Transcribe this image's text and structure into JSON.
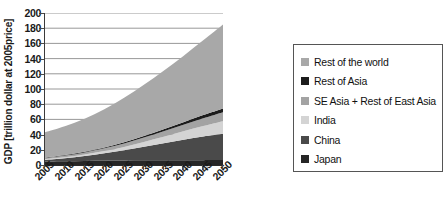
{
  "chart_data": {
    "type": "area",
    "stacked": true,
    "title": "",
    "xlabel": "",
    "ylabel": "GDP [trillion dollar at 2005price]",
    "x": [
      2005,
      2010,
      2015,
      2020,
      2025,
      2030,
      2035,
      2040,
      2045,
      2050
    ],
    "categories": [
      "2005",
      "2010",
      "2015",
      "2020",
      "2025",
      "2030",
      "2035",
      "2040",
      "2045",
      "2050"
    ],
    "ylim": [
      0,
      200
    ],
    "ytick_values": [
      0,
      20,
      40,
      60,
      80,
      100,
      120,
      140,
      160,
      180,
      200
    ],
    "ytick_labels": [
      "0",
      "20",
      "40",
      "60",
      "80",
      "100",
      "120",
      "140",
      "160",
      "180",
      "200"
    ],
    "grid": "horizontal",
    "legend_position": "right",
    "series": [
      {
        "name": "Japan",
        "color": "#262626",
        "values": [
          4.6,
          5.0,
          5.4,
          5.7,
          5.9,
          6.1,
          6.2,
          6.3,
          6.4,
          6.5
        ]
      },
      {
        "name": "China",
        "color": "#4a4a4a",
        "values": [
          2.3,
          4.0,
          6.4,
          9.6,
          13.5,
          18.0,
          22.5,
          27.0,
          31.0,
          34.5
        ]
      },
      {
        "name": "India",
        "color": "#d4d4d4",
        "values": [
          0.9,
          1.3,
          2.0,
          3.0,
          4.4,
          6.2,
          8.4,
          11.0,
          13.8,
          16.5
        ]
      },
      {
        "name": "SE Asia + Rest of East Asia",
        "color": "#a3a3a3",
        "values": [
          1.6,
          2.1,
          2.8,
          3.6,
          4.6,
          5.8,
          7.2,
          8.7,
          10.3,
          12.0
        ]
      },
      {
        "name": "Rest of Asia",
        "color": "#1c1c1c",
        "values": [
          0.5,
          0.7,
          0.9,
          1.2,
          1.6,
          2.1,
          2.7,
          3.4,
          4.2,
          5.0
        ]
      },
      {
        "name": "Rest of the world",
        "color": "#a8a8a8",
        "values": [
          33.1,
          37.9,
          43.5,
          50.4,
          58.5,
          67.3,
          77.0,
          87.1,
          98.3,
          110.5
        ]
      }
    ],
    "totals": [
      43.0,
      51.0,
      61.0,
      73.5,
      88.5,
      105.5,
      124.0,
      143.5,
      164.0,
      185.0
    ]
  },
  "legend": {
    "items": [
      {
        "label": "Rest of the world",
        "color": "#a8a8a8"
      },
      {
        "label": "Rest of Asia",
        "color": "#1c1c1c"
      },
      {
        "label": "SE Asia + Rest of East Asia",
        "color": "#a3a3a3"
      },
      {
        "label": "India",
        "color": "#d4d4d4"
      },
      {
        "label": "China",
        "color": "#4a4a4a"
      },
      {
        "label": "Japan",
        "color": "#262626"
      }
    ]
  }
}
